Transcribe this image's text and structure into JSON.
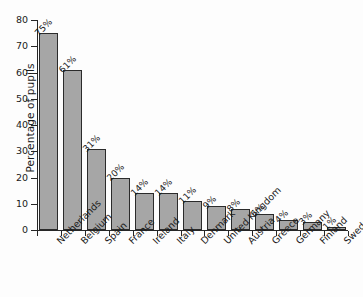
{
  "chart_data": {
    "type": "bar",
    "title": "",
    "xlabel": "",
    "ylabel": "Percentage of pupils",
    "ylim": [
      0,
      80
    ],
    "ytick_values": [
      0,
      10,
      20,
      30,
      40,
      50,
      60,
      70,
      80
    ],
    "ytick_labels": [
      "0",
      "10",
      "20",
      "30",
      "40",
      "50",
      "60",
      "70",
      "80"
    ],
    "grid": false,
    "legend": null,
    "bar_color": "#a6a6a6",
    "bar_edge_color": "#2b2b2b",
    "axis_color": "#262626",
    "background_color": "#fdfdfd",
    "categories": [
      "Netherlands",
      "Belgium",
      "Spain",
      "France",
      "Ireland",
      "Italy",
      "Denmark",
      "United Kingdom",
      "Austria",
      "Greece",
      "Germany",
      "Finland",
      "Sweden"
    ],
    "values": [
      75,
      61,
      31,
      20,
      14,
      14,
      11,
      9,
      8,
      6,
      4,
      3,
      1
    ],
    "data_labels": [
      "75%",
      "61%",
      "31%",
      "20%",
      "14%",
      "14%",
      "11%",
      "9%",
      "8%",
      "6%",
      "4%",
      "3%",
      "1%"
    ]
  }
}
